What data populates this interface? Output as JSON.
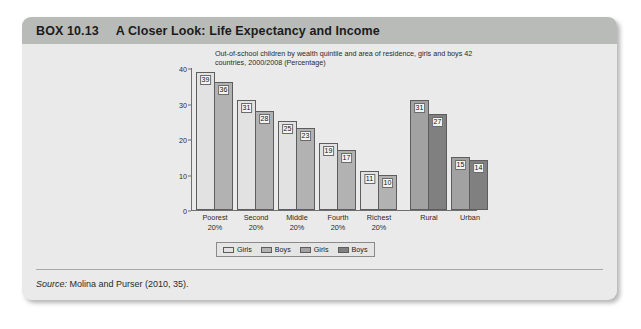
{
  "box": {
    "number": "BOX 10.13",
    "title": "A Closer Look: Life Expectancy and Income",
    "source_word": "Source:",
    "source_text": "Molina and Purser (2010, 35)."
  },
  "colors": {
    "box_body": "#e9eae9",
    "header_bar": "#b9bbb9",
    "girls_quintile": "#e2e2e2",
    "boys_quintile": "#b2b2b2",
    "girls_area": "#a2a2a2",
    "boys_area": "#808080",
    "axis": "#6f6f6f"
  },
  "chart_data": {
    "type": "bar",
    "title": "Out-of-school children by wealth quintile and area of residence, girls and boys 42 countries, 2000/2008 (Percentage)",
    "xlabel": "",
    "ylabel": "",
    "ylim": [
      0,
      40
    ],
    "yticks": [
      0,
      10,
      20,
      30,
      40
    ],
    "grid": false,
    "legend_position": "bottom",
    "categories": [
      "Poorest\n20%",
      "Second\n20%",
      "Middle\n20%",
      "Fourth\n20%",
      "Richest\n20%",
      "Rural",
      "Urban"
    ],
    "category_lines": [
      [
        "Poorest",
        "20%"
      ],
      [
        "Second",
        "20%"
      ],
      [
        "Middle",
        "20%"
      ],
      [
        "Fourth",
        "20%"
      ],
      [
        "Richest",
        "20%"
      ],
      [
        "Rural",
        ""
      ],
      [
        "Urban",
        ""
      ]
    ],
    "series": [
      {
        "name": "Girls",
        "group": "quintile",
        "values": [
          39,
          31,
          25,
          19,
          11,
          null,
          null
        ]
      },
      {
        "name": "Boys",
        "group": "quintile",
        "values": [
          36,
          28,
          23,
          17,
          10,
          null,
          null
        ]
      },
      {
        "name": "Girls",
        "group": "area",
        "values": [
          null,
          null,
          null,
          null,
          null,
          31,
          15
        ]
      },
      {
        "name": "Boys",
        "group": "area",
        "values": [
          null,
          null,
          null,
          null,
          null,
          27,
          14
        ]
      }
    ],
    "bars": [
      {
        "category": "Poorest 20%",
        "series": "Girls",
        "group": "quintile",
        "value": 39
      },
      {
        "category": "Poorest 20%",
        "series": "Boys",
        "group": "quintile",
        "value": 36
      },
      {
        "category": "Second 20%",
        "series": "Girls",
        "group": "quintile",
        "value": 31
      },
      {
        "category": "Second 20%",
        "series": "Boys",
        "group": "quintile",
        "value": 28
      },
      {
        "category": "Middle 20%",
        "series": "Girls",
        "group": "quintile",
        "value": 25
      },
      {
        "category": "Middle 20%",
        "series": "Boys",
        "group": "quintile",
        "value": 23
      },
      {
        "category": "Fourth 20%",
        "series": "Girls",
        "group": "quintile",
        "value": 19
      },
      {
        "category": "Fourth 20%",
        "series": "Boys",
        "group": "quintile",
        "value": 17
      },
      {
        "category": "Richest 20%",
        "series": "Girls",
        "group": "quintile",
        "value": 11
      },
      {
        "category": "Richest 20%",
        "series": "Boys",
        "group": "quintile",
        "value": 10
      },
      {
        "category": "Rural",
        "series": "Girls",
        "group": "area",
        "value": 31
      },
      {
        "category": "Rural",
        "series": "Boys",
        "group": "area",
        "value": 27
      },
      {
        "category": "Urban",
        "series": "Girls",
        "group": "area",
        "value": 15
      },
      {
        "category": "Urban",
        "series": "Boys",
        "group": "area",
        "value": 14
      }
    ],
    "legend": [
      {
        "label": "Girls",
        "group": "quintile",
        "color": "#e2e2e2"
      },
      {
        "label": "Boys",
        "group": "quintile",
        "color": "#b2b2b2"
      },
      {
        "label": "Girls",
        "group": "area",
        "color": "#a2a2a2"
      },
      {
        "label": "Boys",
        "group": "area",
        "color": "#808080"
      }
    ]
  }
}
